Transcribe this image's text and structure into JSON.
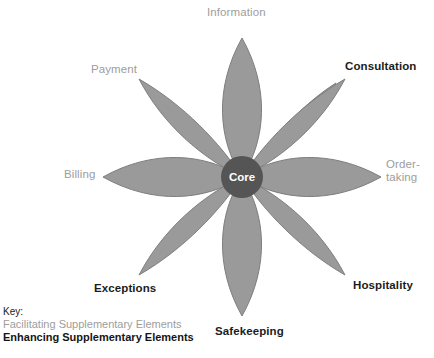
{
  "diagram": {
    "type": "flower-of-service",
    "core": {
      "label": "Core",
      "fill_color": "#555555",
      "text_color": "#ffffff",
      "center_x": 242,
      "center_y": 177,
      "radius": 21
    },
    "petal_style": {
      "fill_color": "#9a9a9a",
      "stroke_color": "#7e7e7e",
      "count": 8,
      "tip_distance": 133
    },
    "petals": [
      {
        "label": "Information",
        "category": "facilitating",
        "angle_deg": 270
      },
      {
        "label": "Consultation",
        "category": "enhancing",
        "angle_deg": 315
      },
      {
        "label": "Order-\ntaking",
        "category": "facilitating",
        "angle_deg": 0
      },
      {
        "label": "Hospitality",
        "category": "enhancing",
        "angle_deg": 45
      },
      {
        "label": "Safekeeping",
        "category": "enhancing",
        "angle_deg": 90
      },
      {
        "label": "Exceptions",
        "category": "enhancing",
        "angle_deg": 135
      },
      {
        "label": "Billing",
        "category": "facilitating",
        "angle_deg": 180
      },
      {
        "label": "Payment",
        "category": "facilitating",
        "angle_deg": 225
      }
    ]
  },
  "key": {
    "title": "Key:",
    "facilitating_label": "Facilitating Supplementary Elements",
    "enhancing_label": "Enhancing Supplementary Elements",
    "facilitating_color": "#9d9d9d",
    "enhancing_color": "#151515"
  }
}
